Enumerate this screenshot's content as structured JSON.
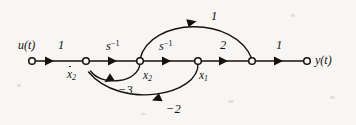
{
  "figure": {
    "kind": "signal-flow-graph",
    "background_color": "#f7f6f4",
    "ink_color": "#14120f"
  },
  "terminals": {
    "input_label": "u(t)",
    "output_label": "y(t)"
  },
  "nodes": [
    {
      "id": "n0",
      "label": "u(t)",
      "x": 32,
      "y": 61,
      "label_position": "above-left"
    },
    {
      "id": "n1",
      "label": "ẋ₂",
      "x": 86,
      "y": 61,
      "label_position": "below"
    },
    {
      "id": "n2",
      "label": "x₂",
      "x": 140,
      "y": 61,
      "label_position": "below"
    },
    {
      "id": "n3",
      "label": "x₁",
      "x": 198,
      "y": 61,
      "label_position": "below"
    },
    {
      "id": "n4",
      "label": "",
      "x": 252,
      "y": 61,
      "label_position": "none"
    },
    {
      "id": "n5",
      "label": "y(t)",
      "x": 307,
      "y": 61,
      "label_position": "right"
    }
  ],
  "node_labels": {
    "x2dot_base": "x",
    "x2dot_sub": "2",
    "x2_base": "x",
    "x2_sub": "2",
    "x1_base": "x",
    "x1_sub": "1"
  },
  "edges": [
    {
      "id": "e1",
      "from": "n0",
      "to": "n1",
      "gain": "1",
      "shape": "straight",
      "gain_position": "above"
    },
    {
      "id": "e2",
      "from": "n1",
      "to": "n2",
      "gain": "s⁻¹",
      "shape": "straight",
      "gain_position": "above"
    },
    {
      "id": "e3",
      "from": "n2",
      "to": "n3",
      "gain": "s⁻¹",
      "shape": "straight",
      "gain_position": "above"
    },
    {
      "id": "e4",
      "from": "n3",
      "to": "n4",
      "gain": "2",
      "shape": "straight",
      "gain_position": "above"
    },
    {
      "id": "e5",
      "from": "n4",
      "to": "n5",
      "gain": "1",
      "shape": "straight",
      "gain_position": "above"
    },
    {
      "id": "e6",
      "from": "n2",
      "to": "n4",
      "gain": "1",
      "shape": "arc-above",
      "gain_position": "above-apex"
    },
    {
      "id": "e7",
      "from": "n2",
      "to": "n1",
      "gain": "−3",
      "shape": "arc-below",
      "gain_position": "below-apex"
    },
    {
      "id": "e8",
      "from": "n3",
      "to": "n1",
      "gain": "−2",
      "shape": "arc-below",
      "gain_position": "below-apex"
    }
  ],
  "gain_labels": {
    "g_u_to_x2dot": "1",
    "g_integrator_1_base": "s",
    "g_integrator_1_exp": "−1",
    "g_integrator_2_base": "s",
    "g_integrator_2_exp": "−1",
    "g_x1_to_n4": "2",
    "g_n4_to_y": "1",
    "g_feedforward_top": "1",
    "g_feedback_minus3": "−3",
    "g_feedback_minus2": "−2"
  }
}
